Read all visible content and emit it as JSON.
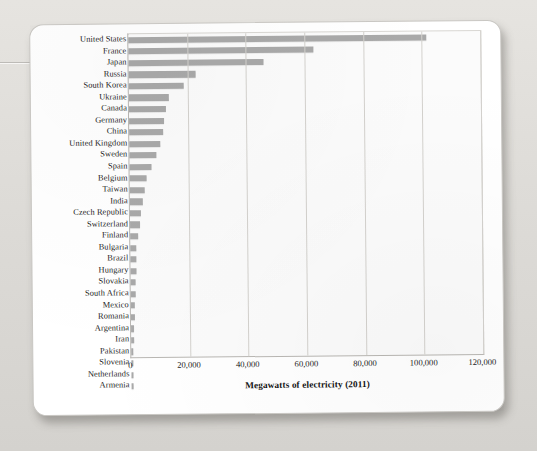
{
  "chart_data": {
    "type": "bar",
    "orientation": "horizontal",
    "title": "",
    "xlabel": "Megawatts of electricity (2011)",
    "ylabel": "",
    "xlim": [
      0,
      120000
    ],
    "xticks": [
      0,
      20000,
      40000,
      60000,
      80000,
      100000,
      120000
    ],
    "xtick_labels": [
      "0",
      "20,000",
      "40,000",
      "60,000",
      "80,000",
      "100,000",
      "120,000"
    ],
    "grid": true,
    "grid_axis": "x",
    "legend": "none",
    "bar_color": "#a9a9a9",
    "categories": [
      "United States",
      "France",
      "Japan",
      "Russia",
      "South Korea",
      "Ukraine",
      "Canada",
      "Germany",
      "China",
      "United Kingdom",
      "Sweden",
      "Spain",
      "Belgium",
      "Taiwan",
      "India",
      "Czech Republic",
      "Switzerland",
      "Finland",
      "Bulgaria",
      "Brazil",
      "Hungary",
      "Slovakia",
      "South Africa",
      "Mexico",
      "Romania",
      "Argentina",
      "Iran",
      "Pakistan",
      "Slovenia",
      "Netherlands",
      "Armenia"
    ],
    "values": [
      101600,
      63100,
      46000,
      22700,
      18700,
      13800,
      12600,
      12100,
      11700,
      10700,
      9300,
      7500,
      5900,
      5000,
      4400,
      3800,
      3300,
      2700,
      2000,
      1900,
      1880,
      1810,
      1800,
      1400,
      1300,
      940,
      920,
      430,
      690,
      480,
      380
    ]
  },
  "axis": {
    "x_title": "Megawatts of electricity (2011)"
  }
}
